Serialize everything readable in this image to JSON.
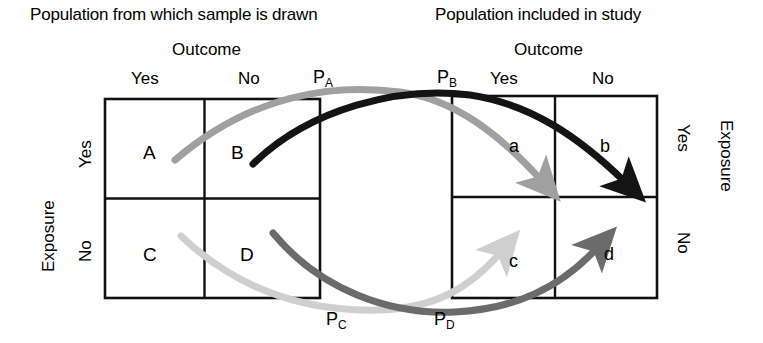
{
  "headers": {
    "left_title": "Population from which sample is drawn",
    "right_title": "Population included in study",
    "left_outcome": "Outcome",
    "right_outcome": "Outcome"
  },
  "left_table": {
    "column_labels": [
      "Yes",
      "No"
    ],
    "row_axis_label": "Exposure",
    "row_labels": [
      "Yes",
      "No"
    ],
    "cells": [
      [
        "A",
        "B"
      ],
      [
        "C",
        "D"
      ]
    ]
  },
  "right_table": {
    "column_labels": [
      "Yes",
      "No"
    ],
    "row_axis_label": "Exposure",
    "row_labels": [
      "Yes",
      "No"
    ],
    "cells": [
      [
        "a",
        "b"
      ],
      [
        "c",
        "d"
      ]
    ]
  },
  "selection_probabilities": {
    "pa": "P",
    "pa_sub": "A",
    "pb": "P",
    "pb_sub": "B",
    "pc": "P",
    "pc_sub": "C",
    "pd": "P",
    "pd_sub": "D"
  },
  "arrows": [
    {
      "id": "arrow-a",
      "from_cell": "A",
      "to_cell": "a",
      "label": "P_A",
      "color": "#a0a0a0"
    },
    {
      "id": "arrow-b",
      "from_cell": "B",
      "to_cell": "b",
      "label": "P_B",
      "color": "#141414"
    },
    {
      "id": "arrow-c",
      "from_cell": "C",
      "to_cell": "c",
      "label": "P_C",
      "color": "#cfcfcf"
    },
    {
      "id": "arrow-d",
      "from_cell": "D",
      "to_cell": "d",
      "label": "P_D",
      "color": "#6b6b6b"
    }
  ],
  "colors": {
    "line": "#111111",
    "arrow_a": "#a0a0a0",
    "arrow_b": "#141414",
    "arrow_c": "#cfcfcf",
    "arrow_d": "#6b6b6b",
    "background": "#ffffff"
  }
}
